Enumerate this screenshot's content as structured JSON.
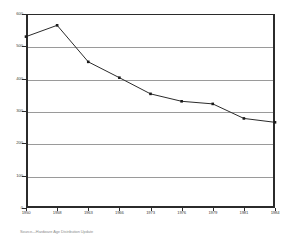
{
  "chart_data": {
    "type": "line",
    "title": "",
    "subtitle": "",
    "xlabel": "",
    "ylabel": "",
    "x": [
      1950,
      1958,
      1963,
      1966,
      1973,
      1976,
      1979,
      1981,
      1984
    ],
    "categories": [
      "1950",
      "1958",
      "1963",
      "1966",
      "1973",
      "1976",
      "1979",
      "1981",
      "1984"
    ],
    "values": [
      530,
      565,
      452,
      403,
      353,
      330,
      322,
      277,
      265
    ],
    "series": [
      {
        "name": "",
        "values": [
          530,
          565,
          452,
          403,
          353,
          330,
          322,
          277,
          265
        ]
      }
    ],
    "ylim": [
      0,
      600
    ],
    "xlim": [
      1950,
      1984
    ],
    "yticks": [
      0,
      100,
      200,
      300,
      400,
      500,
      600
    ],
    "ytick_labels": [
      "0",
      "100",
      "200",
      "300",
      "400",
      "500",
      "600"
    ],
    "xtick_labels": [
      "1950",
      "1958",
      "1963",
      "1966",
      "1973",
      "1976",
      "1979",
      "1981",
      "1984"
    ],
    "grid": true,
    "grid_axis": "y",
    "legend": false,
    "legend_position": "none",
    "marker": "square",
    "line_color": "#2b2b2b",
    "marker_color": "#1a1a1a",
    "grid_color": "#9a9a9a",
    "axis_color": "#2b2b2b",
    "background_color": "#ffffff"
  },
  "footer": {
    "source_note": "Source—Hardware Age Distribution Update"
  }
}
